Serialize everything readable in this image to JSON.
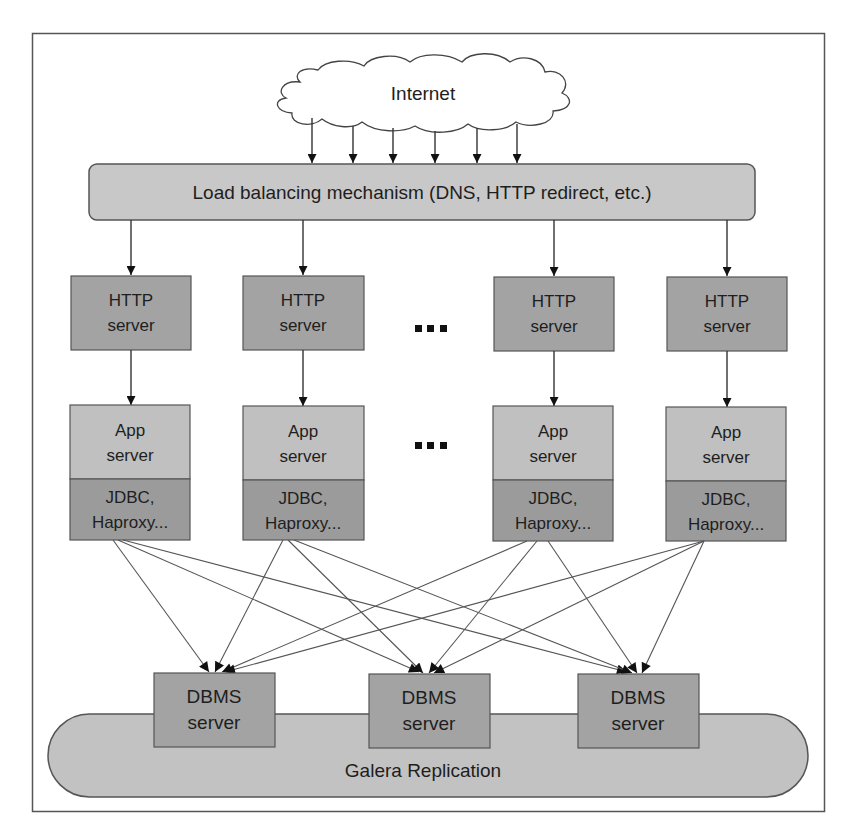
{
  "diagram": {
    "internet": {
      "label": "Internet"
    },
    "load_balancer": {
      "label": "Load balancing mechanism (DNS, HTTP redirect, etc.)"
    },
    "ellipsis": "...",
    "http_servers": [
      {
        "line1": "HTTP",
        "line2": "server"
      },
      {
        "line1": "HTTP",
        "line2": "server"
      },
      {
        "line1": "HTTP",
        "line2": "server"
      },
      {
        "line1": "HTTP",
        "line2": "server"
      }
    ],
    "app_servers": [
      {
        "line1": "App",
        "line2": "server",
        "conn1": "JDBC,",
        "conn2": "Haproxy..."
      },
      {
        "line1": "App",
        "line2": "server",
        "conn1": "JDBC,",
        "conn2": "Haproxy..."
      },
      {
        "line1": "App",
        "line2": "server",
        "conn1": "JDBC,",
        "conn2": "Haproxy..."
      },
      {
        "line1": "App",
        "line2": "server",
        "conn1": "JDBC,",
        "conn2": "Haproxy..."
      }
    ],
    "dbms_servers": [
      {
        "line1": "DBMS",
        "line2": "server"
      },
      {
        "line1": "DBMS",
        "line2": "server"
      },
      {
        "line1": "DBMS",
        "line2": "server"
      }
    ],
    "replication": {
      "label": "Galera Replication"
    },
    "colors": {
      "frame": "#555555",
      "cloud_fill": "#ffffff",
      "lb_fill": "#c8c8c8",
      "http_fill": "#a3a3a3",
      "app_fill": "#c0c0c0",
      "conn_fill": "#9b9b9b",
      "dbms_fill": "#a3a3a3",
      "galera_fill": "#c2c2c2",
      "line": "#4a4a4a",
      "text": "#1e1e1e"
    }
  }
}
